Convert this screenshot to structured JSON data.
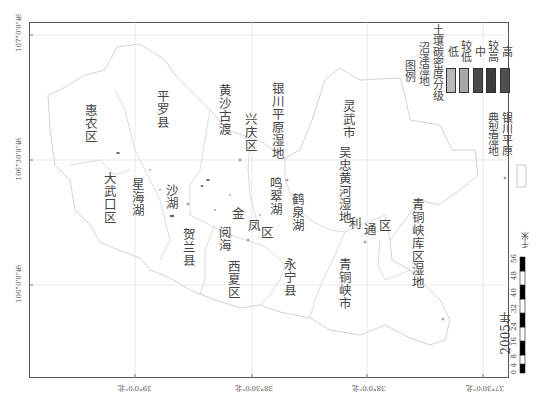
{
  "map": {
    "year": "2005年",
    "coords_left": [
      {
        "label": "107°0'0\"东",
        "y": 35
      },
      {
        "label": "106°30'0\"东",
        "y": 160
      },
      {
        "label": "106°0'0\"东",
        "y": 285
      }
    ],
    "coords_bottom": [
      {
        "label": "39°0'0\"北",
        "x": 135
      },
      {
        "label": "38°30'0\"北",
        "x": 252
      },
      {
        "label": "38°0'0\"北",
        "x": 367
      },
      {
        "label": "37°30'0\"北",
        "x": 483
      }
    ],
    "regions": [
      {
        "name": "惠农区"
      },
      {
        "name": "平罗县"
      },
      {
        "name": "大武口区"
      },
      {
        "name": "星海湖"
      },
      {
        "name": "沙湖"
      },
      {
        "name": "贺兰县"
      },
      {
        "name": "黄沙古渡"
      },
      {
        "name": "兴庆区"
      },
      {
        "name": "银川平原湿地"
      },
      {
        "name": "阅海"
      },
      {
        "name": "金"
      },
      {
        "name": "凤"
      },
      {
        "name": "区"
      },
      {
        "name": "鸣翠湖"
      },
      {
        "name": "鹤泉湖"
      },
      {
        "name": "西夏区"
      },
      {
        "name": "永宁县"
      },
      {
        "name": "吴忠黄河湿地"
      },
      {
        "name": "灵武市"
      },
      {
        "name": "利"
      },
      {
        "name": "通"
      },
      {
        "name": "区"
      },
      {
        "name": "青铜峡市"
      },
      {
        "name": "青铜峡库区湿地"
      }
    ]
  },
  "legend": {
    "title": "图例",
    "subtitle1": "沼泽湿地",
    "subtitle2": "土壤碳密度分级",
    "classes": [
      {
        "label": "低",
        "color": "#b8b8b8"
      },
      {
        "label": "较低",
        "color": "#a8a8a8"
      },
      {
        "label": "中",
        "color": "#4a4a4a"
      },
      {
        "label": "较高",
        "color": "#3c3c3c"
      },
      {
        "label": "高",
        "color": "#505050"
      }
    ],
    "typical_label1": "典型湿地",
    "typical_label2": "银川平原"
  },
  "scale_bar": {
    "ticks": [
      "0",
      "4",
      "8",
      "16",
      "24",
      "32",
      "40",
      "48",
      "56"
    ],
    "unit": "千米"
  }
}
